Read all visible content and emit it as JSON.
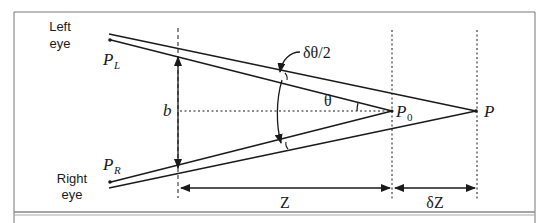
{
  "diagram": {
    "type": "stereo-depth-geometry",
    "labels": {
      "left_eye_line1": "Left",
      "left_eye_line2": "eye",
      "right_eye_line1": "Right",
      "right_eye_line2": "eye",
      "p_left_main": "P",
      "p_left_sub": "L",
      "p_right_main": "P",
      "p_right_sub": "R",
      "baseline": "b",
      "half_delta_theta": "δθ/2",
      "theta": "θ",
      "p0_main": "P",
      "p0_sub": "0",
      "p": "P",
      "z": "Z",
      "delta_z": "δZ"
    },
    "colors": {
      "ink": "#1a1a1a",
      "frame": "#6b6b6b",
      "background": "#ffffff"
    }
  }
}
